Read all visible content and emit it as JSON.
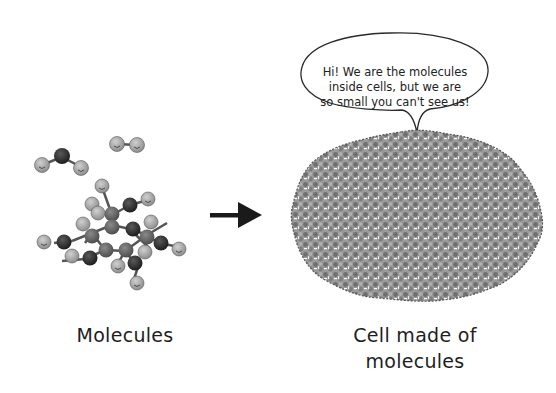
{
  "diagram": {
    "left": {
      "label": "Molecules",
      "icon": "molecule-cluster-icon"
    },
    "arrow": {
      "icon": "arrow-right-icon",
      "color": "#1a1a1a"
    },
    "right": {
      "label_line1": "Cell made of",
      "label_line2": "molecules",
      "icon": "cell-icon",
      "speech_bubble": {
        "line1": "Hi! We are the molecules",
        "line2": "inside cells, but we are",
        "line3": "so small you can't see us!"
      }
    },
    "colors": {
      "background": "#ffffff",
      "molecule_light": "#a8a8a8",
      "molecule_dark": "#3a3a3a",
      "molecule_mid": "#6e6e6e",
      "cell_fill": "#8c8c8c",
      "text": "#1e1e1e"
    }
  }
}
